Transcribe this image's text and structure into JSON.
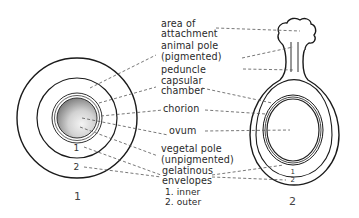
{
  "figure": {
    "type": "anatomical diagram",
    "panels": [
      {
        "id": "1",
        "caption": "1",
        "ring_numbers": [
          "1",
          "2"
        ]
      },
      {
        "id": "2",
        "caption": "2",
        "ring_numbers": [
          "1",
          "2"
        ]
      }
    ]
  },
  "labels": {
    "area_of_attachment_1": "area of",
    "area_of_attachment_2": "attachment",
    "animal_pole_1": "animal pole",
    "animal_pole_2": "(pigmented)",
    "peduncle": "peduncle",
    "capsular_chamber_1": "capsular",
    "capsular_chamber_2": "chamber",
    "chorion": "chorion",
    "ovum": "ovum",
    "vegetal_pole_1": "vegetal pole",
    "vegetal_pole_2": "(unpigmented)",
    "gelatinous_envelopes_1": "gelatinous",
    "gelatinous_envelopes_2": "envelopes",
    "inner": "1. inner",
    "outer": "2. outer"
  },
  "colors": {
    "line": "#1a1a1a",
    "leader": "#555555",
    "ovum_light": "#f2f2f2",
    "ovum_dark": "#8a8a8a"
  }
}
